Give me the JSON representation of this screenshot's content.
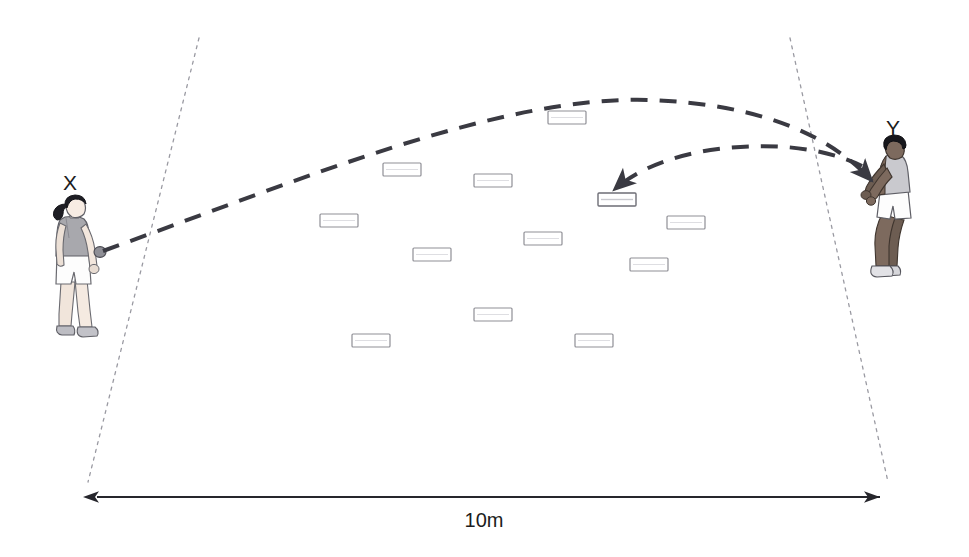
{
  "diagram": {
    "background_color": "#ffffff",
    "width": 969,
    "height": 557,
    "ink_color": "#3a3a42",
    "boundary_color": "#9a9aa2",
    "marker_border_color": "#8f8f96",
    "marker_fill_color": "#ffffff",
    "dimension_color": "#26262c"
  },
  "players": [
    {
      "id": "player-x",
      "label": "X",
      "label_x": 70,
      "label_y": 190,
      "role": "thrower",
      "stance": "standing upright holding ball",
      "x": 45,
      "y": 196,
      "width": 62,
      "height": 140,
      "hair": "ponytail",
      "skin": "#efe2d8",
      "hair_color": "#1e1e24",
      "top_color": "#a8a8ad",
      "shorts_color": "#fdfdfd",
      "shoe_color": "#b9b9bf"
    },
    {
      "id": "player-y",
      "label": "Y",
      "label_x": 893,
      "label_y": 135,
      "role": "receiver",
      "stance": "crouched ready position arms forward",
      "x": 862,
      "y": 140,
      "width": 62,
      "height": 142,
      "hair": "short",
      "skin": "#7d6a5e",
      "hair_color": "#17171c",
      "top_color": "#c9c9ce",
      "shorts_color": "#fdfdfd",
      "shoe_color": "#d6d6da"
    }
  ],
  "boundary_lines": [
    {
      "id": "boundary-left",
      "x1": 199,
      "y1": 38,
      "x2": 88,
      "y2": 482,
      "style": "fine-dotted"
    },
    {
      "id": "boundary-right",
      "x1": 790,
      "y1": 38,
      "x2": 888,
      "y2": 482,
      "style": "fine-dotted"
    }
  ],
  "trajectories": [
    {
      "id": "throw-x-to-y",
      "description": "long throw from player X over the markers to player Y",
      "from": "X",
      "to": "Y",
      "path": "M 103,251 C 300,180 500,95 650,100 C 760,104 830,135 872,181",
      "arrowhead": true,
      "arrow_at": {
        "x": 872,
        "y": 181
      }
    },
    {
      "id": "throw-y-to-marker",
      "description": "short return throw from player Y down onto a marker",
      "from": "Y",
      "to": "marker",
      "path": "M 862,166 C 820,146 770,143 718,149 C 672,155 636,170 614,190",
      "arrowhead": true,
      "arrow_at": {
        "x": 614,
        "y": 190
      }
    }
  ],
  "markers": {
    "shape": "rectangle",
    "count": 12,
    "size": {
      "width": 38,
      "height": 13
    },
    "items": [
      {
        "id": "marker-1",
        "x": 548,
        "y": 111
      },
      {
        "id": "marker-2",
        "x": 383,
        "y": 163
      },
      {
        "id": "marker-3",
        "x": 474,
        "y": 174
      },
      {
        "id": "marker-4",
        "x": 598,
        "y": 193,
        "targeted": true
      },
      {
        "id": "marker-5",
        "x": 320,
        "y": 214
      },
      {
        "id": "marker-6",
        "x": 524,
        "y": 232
      },
      {
        "id": "marker-7",
        "x": 413,
        "y": 248
      },
      {
        "id": "marker-8",
        "x": 630,
        "y": 258
      },
      {
        "id": "marker-9",
        "x": 474,
        "y": 308
      },
      {
        "id": "marker-10",
        "x": 352,
        "y": 334
      },
      {
        "id": "marker-11",
        "x": 575,
        "y": 334
      },
      {
        "id": "marker-12",
        "x": 667,
        "y": 216
      }
    ]
  },
  "dimension": {
    "id": "width-dimension",
    "label": "10m",
    "label_x": 484,
    "label_y": 527,
    "line_y": 497,
    "x_start": 97,
    "x_end": 880,
    "arrowheads": "both"
  }
}
